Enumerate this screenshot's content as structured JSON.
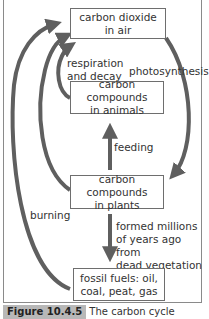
{
  "diagram": {
    "title": "The carbon cycle",
    "nodes": {
      "co2": {
        "line1": "carbon dioxide",
        "line2": "in air"
      },
      "animals": {
        "line1": "carbon compounds",
        "line2": "in animals"
      },
      "plants": {
        "line1": "carbon compounds",
        "line2": "in plants"
      },
      "fossil": {
        "line1": "fossil fuels: oil,",
        "line2": "coal, peat, gas"
      }
    },
    "edges": {
      "respiration": {
        "line1": "respiration",
        "line2": "and decay"
      },
      "photosynthesis": "photosynthesis",
      "feeding": "feeding",
      "formed": {
        "line1": "formed millions",
        "line2": "of years ago from",
        "line3": "dead vegetation"
      },
      "burning": "burning"
    },
    "arrow_color": "#5f5f5f"
  },
  "caption": {
    "figure": "Figure 10.4.5",
    "text": "The carbon cycle"
  }
}
